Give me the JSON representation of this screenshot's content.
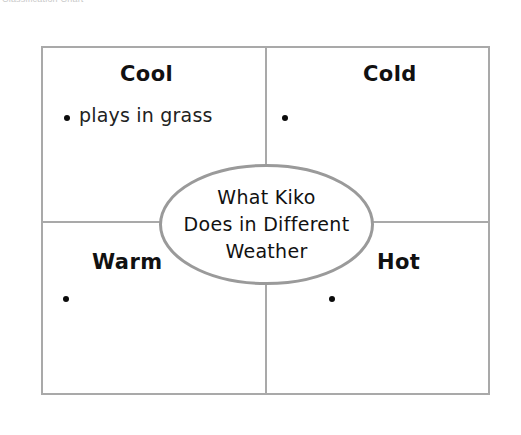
{
  "document": {
    "caption": "Classification Chart",
    "type": "graphic-organizer",
    "layout": "four-quadrant-with-center-oval"
  },
  "colors": {
    "frame_stroke": "#a9a9a9",
    "oval_stroke": "#9a9a9a",
    "text": "#111111",
    "bullet": "#0b0b0b",
    "background": "#ffffff"
  },
  "center": {
    "lines": [
      "What Kiko",
      "Does in Different",
      "Weather"
    ]
  },
  "quadrants": [
    {
      "id": "top-left",
      "title": "Cool",
      "bullets": [
        {
          "text": "plays in grass",
          "empty": false
        }
      ]
    },
    {
      "id": "top-right",
      "title": "Cold",
      "bullets": [
        {
          "text": "",
          "empty": true
        }
      ]
    },
    {
      "id": "bottom-left",
      "title": "Warm",
      "bullets": [
        {
          "text": "",
          "empty": true
        }
      ]
    },
    {
      "id": "bottom-right",
      "title": "Hot",
      "bullets": [
        {
          "text": "",
          "empty": true
        }
      ]
    }
  ]
}
